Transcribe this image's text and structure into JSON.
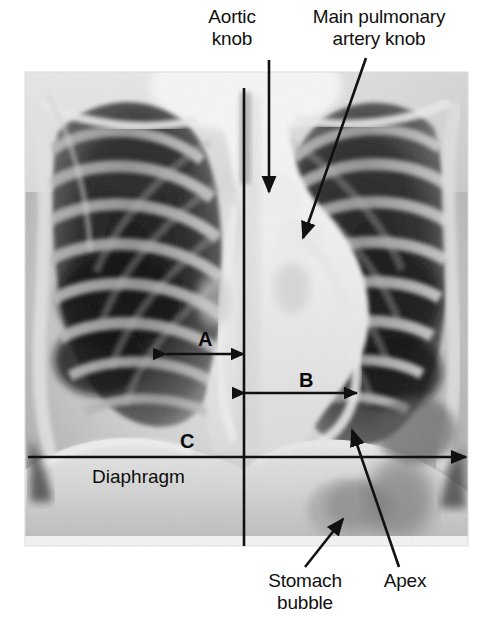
{
  "figure": {
    "type": "annotated-medical-image",
    "modality": "chest-radiograph",
    "view": "posteroanterior",
    "canvas": {
      "width": 480,
      "height": 621
    },
    "background_color": "#ffffff",
    "annotation_color": "#111111"
  },
  "image_panel": {
    "name": "chest-xray",
    "bounds": {
      "x": 25,
      "y": 72,
      "width": 443,
      "height": 474
    },
    "tones": {
      "lung_field_dark": "#1b1b1b",
      "rib_mid": "#8d8d8d",
      "soft_tissue": "#cfcfcf",
      "mediastinum_bright": "#f2f2f2",
      "border": "#d8d8d8"
    }
  },
  "annotations": {
    "aortic_knob": {
      "label": "Aortic\nknob",
      "label_x": 231,
      "label_y": 8,
      "arrow": {
        "x1": 269,
        "y1": 60,
        "x2": 269,
        "y2": 192
      }
    },
    "main_pulmonary_artery_knob": {
      "label": "Main pulmonary\nartery knob",
      "label_x": 314,
      "label_y": 8,
      "arrow": {
        "x1": 365,
        "y1": 58,
        "x2": 302,
        "y2": 239
      }
    },
    "stomach_bubble": {
      "label": "Stomach\nbubble",
      "label_x": 305,
      "label_y": 573,
      "arrow": {
        "x1": 306,
        "y1": 566,
        "x2": 342,
        "y2": 519
      }
    },
    "apex": {
      "label": "Apex",
      "label_x": 404,
      "label_y": 573,
      "arrow": {
        "x1": 398,
        "y1": 566,
        "x2": 352,
        "y2": 430
      }
    },
    "diaphragm": {
      "label": "Diaphragm",
      "label_x": 92,
      "label_y": 475
    }
  },
  "measurements": {
    "midline": {
      "name": "vertical-midline",
      "x": 244,
      "y1": 88,
      "y2": 546
    },
    "A": {
      "letter": "A",
      "letter_x": 198,
      "letter_y": 329,
      "line_y": 354,
      "x1": 165,
      "x2": 245,
      "arrowheads": "both",
      "meaning": "right heart border to midline"
    },
    "B": {
      "letter": "B",
      "letter_x": 299,
      "letter_y": 370,
      "line_y": 393,
      "x1": 244,
      "x2": 358,
      "arrowheads": "both",
      "meaning": "midline to left heart border"
    },
    "C": {
      "letter": "C",
      "letter_x": 180,
      "letter_y": 431,
      "line_y": 457,
      "x1": 28,
      "x2": 466,
      "arrowheads": "right",
      "meaning": "maximum internal thoracic diameter"
    }
  }
}
